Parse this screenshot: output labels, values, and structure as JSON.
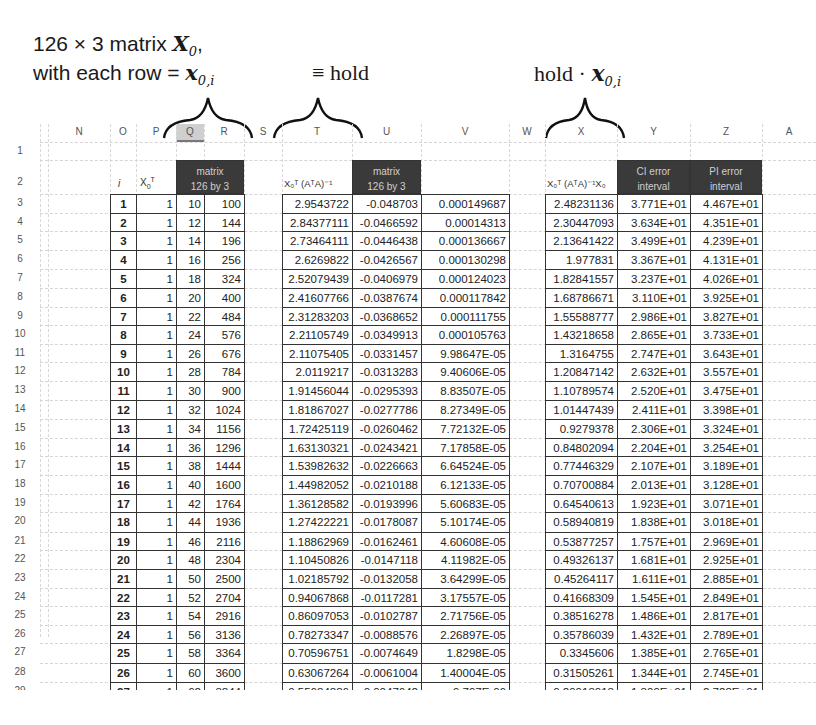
{
  "annotations": {
    "line1": "126 × 3 matrix ",
    "line1_var": "X",
    "line1_sub": "0",
    "line1_tail": ",",
    "line2": "with each row = ",
    "line2_var": "x",
    "line2_sub": "0,i",
    "hold_label": "≡ hold",
    "hold_dot_label": "hold · ",
    "hold_dot_var": "x",
    "hold_dot_sub": "0,i"
  },
  "spreadsheet": {
    "column_headers": [
      "N",
      "O",
      "P",
      "Q",
      "R",
      "S",
      "T",
      "U",
      "V",
      "W",
      "X",
      "Y",
      "Z",
      "A"
    ],
    "row_numbers": [
      "1",
      "2",
      "3",
      "4",
      "5",
      "6",
      "7",
      "8",
      "9",
      "10",
      "11",
      "12",
      "13",
      "14",
      "15",
      "16",
      "17",
      "18",
      "19",
      "20",
      "21",
      "22",
      "23",
      "24",
      "25",
      "26",
      "27",
      "28",
      "29",
      "30"
    ],
    "headers": {
      "i": "i",
      "x0t": "X",
      "x0t_sub": "0",
      "x0t_sup": "T",
      "matrix1_line1": "matrix",
      "matrix1_line2": "126 by 3",
      "t_col": "X₀ᵀ (AᵀA)⁻¹",
      "matrix2_line1": "matrix",
      "matrix2_line2": "126 by 3",
      "x_col": "X₀ᵀ (AᵀA)⁻¹X₀",
      "ci_line1": "CI error",
      "ci_line2": "interval",
      "pi_line1": "PI error",
      "pi_line2": "interval"
    },
    "rows": [
      {
        "i": "1",
        "p": "1",
        "q": "10",
        "r": "100",
        "t": "2.9543722",
        "u": "-0.048703",
        "v": "0.000149687",
        "x": "2.48231136",
        "y": "3.771E+01",
        "z": "4.467E+01"
      },
      {
        "i": "2",
        "p": "1",
        "q": "12",
        "r": "144",
        "t": "2.84377111",
        "u": "-0.0466592",
        "v": "0.00014313",
        "x": "2.30447093",
        "y": "3.634E+01",
        "z": "4.351E+01"
      },
      {
        "i": "3",
        "p": "1",
        "q": "14",
        "r": "196",
        "t": "2.73464111",
        "u": "-0.0446438",
        "v": "0.000136667",
        "x": "2.13641422",
        "y": "3.499E+01",
        "z": "4.239E+01"
      },
      {
        "i": "4",
        "p": "1",
        "q": "16",
        "r": "256",
        "t": "2.6269822",
        "u": "-0.0426567",
        "v": "0.000130298",
        "x": "1.977831",
        "y": "3.367E+01",
        "z": "4.131E+01"
      },
      {
        "i": "5",
        "p": "1",
        "q": "18",
        "r": "324",
        "t": "2.52079439",
        "u": "-0.0406979",
        "v": "0.000124023",
        "x": "1.82841557",
        "y": "3.237E+01",
        "z": "4.026E+01"
      },
      {
        "i": "6",
        "p": "1",
        "q": "20",
        "r": "400",
        "t": "2.41607766",
        "u": "-0.0387674",
        "v": "0.000117842",
        "x": "1.68786671",
        "y": "3.110E+01",
        "z": "3.925E+01"
      },
      {
        "i": "7",
        "p": "1",
        "q": "22",
        "r": "484",
        "t": "2.31283203",
        "u": "-0.0368652",
        "v": "0.000111755",
        "x": "1.55588777",
        "y": "2.986E+01",
        "z": "3.827E+01"
      },
      {
        "i": "8",
        "p": "1",
        "q": "24",
        "r": "576",
        "t": "2.21105749",
        "u": "-0.0349913",
        "v": "0.000105763",
        "x": "1.43218658",
        "y": "2.865E+01",
        "z": "3.733E+01"
      },
      {
        "i": "9",
        "p": "1",
        "q": "26",
        "r": "676",
        "t": "2.11075405",
        "u": "-0.0331457",
        "v": "9.98647E-05",
        "x": "1.3164755",
        "y": "2.747E+01",
        "z": "3.643E+01"
      },
      {
        "i": "10",
        "p": "1",
        "q": "28",
        "r": "784",
        "t": "2.0119217",
        "u": "-0.0313283",
        "v": "9.40606E-05",
        "x": "1.20847142",
        "y": "2.632E+01",
        "z": "3.557E+01"
      },
      {
        "i": "11",
        "p": "1",
        "q": "30",
        "r": "900",
        "t": "1.91456044",
        "u": "-0.0295393",
        "v": "8.83507E-05",
        "x": "1.10789574",
        "y": "2.520E+01",
        "z": "3.475E+01"
      },
      {
        "i": "12",
        "p": "1",
        "q": "32",
        "r": "1024",
        "t": "1.81867027",
        "u": "-0.0277786",
        "v": "8.27349E-05",
        "x": "1.01447439",
        "y": "2.411E+01",
        "z": "3.398E+01"
      },
      {
        "i": "13",
        "p": "1",
        "q": "34",
        "r": "1156",
        "t": "1.72425119",
        "u": "-0.0260462",
        "v": "7.72132E-05",
        "x": "0.9279378",
        "y": "2.306E+01",
        "z": "3.324E+01"
      },
      {
        "i": "14",
        "p": "1",
        "q": "36",
        "r": "1296",
        "t": "1.63130321",
        "u": "-0.0243421",
        "v": "7.17858E-05",
        "x": "0.84802094",
        "y": "2.204E+01",
        "z": "3.254E+01"
      },
      {
        "i": "15",
        "p": "1",
        "q": "38",
        "r": "1444",
        "t": "1.53982632",
        "u": "-0.0226663",
        "v": "6.64524E-05",
        "x": "0.77446329",
        "y": "2.107E+01",
        "z": "3.189E+01"
      },
      {
        "i": "16",
        "p": "1",
        "q": "40",
        "r": "1600",
        "t": "1.44982052",
        "u": "-0.0210188",
        "v": "6.12133E-05",
        "x": "0.70700884",
        "y": "2.013E+01",
        "z": "3.128E+01"
      },
      {
        "i": "17",
        "p": "1",
        "q": "42",
        "r": "1764",
        "t": "1.36128582",
        "u": "-0.0193996",
        "v": "5.60683E-05",
        "x": "0.64540613",
        "y": "1.923E+01",
        "z": "3.071E+01"
      },
      {
        "i": "18",
        "p": "1",
        "q": "44",
        "r": "1936",
        "t": "1.27422221",
        "u": "-0.0178087",
        "v": "5.10174E-05",
        "x": "0.58940819",
        "y": "1.838E+01",
        "z": "3.018E+01"
      },
      {
        "i": "19",
        "p": "1",
        "q": "46",
        "r": "2116",
        "t": "1.18862969",
        "u": "-0.0162461",
        "v": "4.60608E-05",
        "x": "0.53877257",
        "y": "1.757E+01",
        "z": "2.969E+01"
      },
      {
        "i": "20",
        "p": "1",
        "q": "48",
        "r": "2304",
        "t": "1.10450826",
        "u": "-0.0147118",
        "v": "4.11982E-05",
        "x": "0.49326137",
        "y": "1.681E+01",
        "z": "2.925E+01"
      },
      {
        "i": "21",
        "p": "1",
        "q": "50",
        "r": "2500",
        "t": "1.02185792",
        "u": "-0.0132058",
        "v": "3.64299E-05",
        "x": "0.45264117",
        "y": "1.611E+01",
        "z": "2.885E+01"
      },
      {
        "i": "22",
        "p": "1",
        "q": "52",
        "r": "2704",
        "t": "0.94067868",
        "u": "-0.0117281",
        "v": "3.17557E-05",
        "x": "0.41668309",
        "y": "1.545E+01",
        "z": "2.849E+01"
      },
      {
        "i": "23",
        "p": "1",
        "q": "54",
        "r": "2916",
        "t": "0.86097053",
        "u": "-0.0102787",
        "v": "2.71756E-05",
        "x": "0.38516278",
        "y": "1.486E+01",
        "z": "2.817E+01"
      },
      {
        "i": "24",
        "p": "1",
        "q": "56",
        "r": "3136",
        "t": "0.78273347",
        "u": "-0.0088576",
        "v": "2.26897E-05",
        "x": "0.35786039",
        "y": "1.432E+01",
        "z": "2.789E+01"
      },
      {
        "i": "25",
        "p": "1",
        "q": "58",
        "r": "3364",
        "t": "0.70596751",
        "u": "-0.0074649",
        "v": "1.8298E-05",
        "x": "0.3345606",
        "y": "1.385E+01",
        "z": "2.765E+01"
      },
      {
        "i": "26",
        "p": "1",
        "q": "60",
        "r": "3600",
        "t": "0.63067264",
        "u": "-0.0061004",
        "v": "1.40004E-05",
        "x": "0.31505261",
        "y": "1.344E+01",
        "z": "2.745E+01"
      },
      {
        "i": "27",
        "p": "1",
        "q": "62",
        "r": "3844",
        "t": "0.55684886",
        "u": "-0.0047642",
        "v": "9.797E-06",
        "x": "0.29913013",
        "y": "1.309E+01",
        "z": "2.728E+01"
      },
      {
        "i": "28",
        "p": "1",
        "q": "64",
        "r": "4096",
        "t": "0.48449617",
        "u": "-0.0034563",
        "v": "5.68775E-06",
        "x": "0.28659139",
        "y": "1.281E+01",
        "z": "2.715E+01"
      }
    ]
  }
}
